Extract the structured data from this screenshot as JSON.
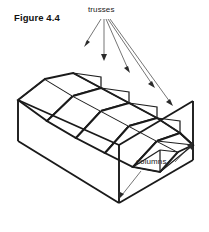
{
  "figure": {
    "number_label": "Figure 4.4",
    "kind": "isometric-line-drawing",
    "background_color": "#ffffff",
    "line_color": "#1a1a1a",
    "leader_color": "#3a3a3a"
  },
  "annotations": {
    "trusses": {
      "label": "trusses",
      "leader_count": 5,
      "points_to": "roof truss triangles along the right gable end"
    },
    "columns": {
      "label": "columns",
      "leader_count": 2,
      "points_to": "front-left and front-right vertical corner posts"
    }
  },
  "geometry": {
    "bay_count": 5,
    "roof_type": "sawtooth",
    "wall_faces": [
      "front-long-face",
      "left-end-face",
      "right-end-face"
    ]
  }
}
